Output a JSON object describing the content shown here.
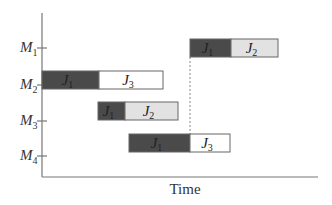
{
  "chart_data": {
    "type": "gantt",
    "title": "",
    "xlabel": "Time",
    "ylabel": "",
    "machines": [
      {
        "id": "M1",
        "letter": "M",
        "sub": "1"
      },
      {
        "id": "M2",
        "letter": "M",
        "sub": "2"
      },
      {
        "id": "M3",
        "letter": "M",
        "sub": "3"
      },
      {
        "id": "M4",
        "letter": "M",
        "sub": "4"
      }
    ],
    "tasks": [
      {
        "machine": "M1",
        "job": "J1",
        "letter": "J",
        "sub": "1",
        "start": 148,
        "end": 189,
        "fill": "#4a4a4a"
      },
      {
        "machine": "M1",
        "job": "J2",
        "letter": "J",
        "sub": "2",
        "start": 189,
        "end": 236,
        "fill": "#e2e2e2"
      },
      {
        "machine": "M2",
        "job": "J1",
        "letter": "J",
        "sub": "1",
        "start": 0,
        "end": 57,
        "fill": "#4a4a4a"
      },
      {
        "machine": "M2",
        "job": "J3",
        "letter": "J",
        "sub": "3",
        "start": 57,
        "end": 121,
        "fill": "#ffffff"
      },
      {
        "machine": "M3",
        "job": "J1",
        "letter": "J",
        "sub": "1",
        "start": 56,
        "end": 83,
        "fill": "#4a4a4a"
      },
      {
        "machine": "M3",
        "job": "J2",
        "letter": "J",
        "sub": "2",
        "start": 83,
        "end": 136,
        "fill": "#e2e2e2"
      },
      {
        "machine": "M4",
        "job": "J1",
        "letter": "J",
        "sub": "1",
        "start": 87,
        "end": 148,
        "fill": "#4a4a4a"
      },
      {
        "machine": "M4",
        "job": "J3",
        "letter": "J",
        "sub": "3",
        "start": 148,
        "end": 188,
        "fill": "#ffffff"
      }
    ],
    "annotations": [
      {
        "type": "dashed-vertical-line",
        "x": 148,
        "from_machine": "M4",
        "to_machine": "M1"
      }
    ],
    "grid": false,
    "legend": "none"
  },
  "labels": {
    "x_axis": "Time"
  }
}
